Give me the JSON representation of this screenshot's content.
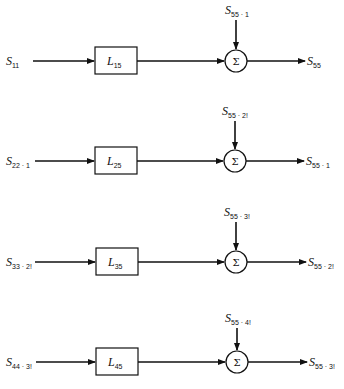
{
  "diagram": {
    "type": "block-diagram",
    "rows": [
      {
        "input": {
          "main": "S",
          "sub": "11"
        },
        "block": {
          "main": "L",
          "sub": "15"
        },
        "summer_symbol": "Σ",
        "top_input": {
          "main": "S",
          "sub": "55 · 1"
        },
        "output": {
          "main": "S",
          "sub": "55"
        }
      },
      {
        "input": {
          "main": "S",
          "sub": "22 · 1"
        },
        "block": {
          "main": "L",
          "sub": "25"
        },
        "summer_symbol": "Σ",
        "top_input": {
          "main": "S",
          "sub": "55 · 2!"
        },
        "output": {
          "main": "S",
          "sub": "55 · 1"
        }
      },
      {
        "input": {
          "main": "S",
          "sub": "33 · 2!"
        },
        "block": {
          "main": "L",
          "sub": "35"
        },
        "summer_symbol": "Σ",
        "top_input": {
          "main": "S",
          "sub": "55 · 3!"
        },
        "output": {
          "main": "S",
          "sub": "55 · 2!"
        }
      },
      {
        "input": {
          "main": "S",
          "sub": "44 · 3!"
        },
        "block": {
          "main": "L",
          "sub": "45"
        },
        "summer_symbol": "Σ",
        "top_input": {
          "main": "S",
          "sub": "55 · 4!"
        },
        "output": {
          "main": "S",
          "sub": "55 · 3!"
        }
      }
    ],
    "colors": {
      "stroke": "#111111",
      "background": "#ffffff"
    }
  }
}
